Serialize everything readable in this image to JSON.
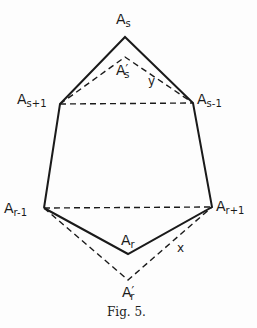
{
  "figure": {
    "caption": "Fig. 5.",
    "vertices": {
      "As": {
        "base": "A",
        "sub": "s",
        "prime": "",
        "x": 125,
        "y": 37
      },
      "Asp": {
        "base": "A",
        "sub": "s",
        "prime": "′",
        "x": 125,
        "y": 57
      },
      "As1p": {
        "base": "A",
        "sub": "s+1",
        "prime": "",
        "x": 60,
        "y": 104
      },
      "As1m": {
        "base": "A",
        "sub": "s-1",
        "prime": "",
        "x": 193,
        "y": 103
      },
      "Ar1m": {
        "base": "A",
        "sub": "r-1",
        "prime": "",
        "x": 44,
        "y": 208
      },
      "Ar1p": {
        "base": "A",
        "sub": "r+1",
        "prime": "",
        "x": 212,
        "y": 207
      },
      "Ar": {
        "base": "A",
        "sub": "r",
        "prime": "",
        "x": 128,
        "y": 254
      },
      "Arp": {
        "base": "A",
        "sub": "r",
        "prime": "′",
        "x": 128,
        "y": 280
      }
    },
    "variables": {
      "y": "y",
      "x": "x"
    },
    "solid_edges": [
      [
        "As",
        "As1p"
      ],
      [
        "As",
        "As1m"
      ],
      [
        "As1p",
        "Ar1m"
      ],
      [
        "As1m",
        "Ar1p"
      ],
      [
        "Ar1m",
        "Ar"
      ],
      [
        "Ar1p",
        "Ar"
      ]
    ],
    "dashed_edges": [
      [
        "As1p",
        "Asp"
      ],
      [
        "As1m",
        "Asp"
      ],
      [
        "As1p",
        "As1m"
      ],
      [
        "Ar1m",
        "Ar1p"
      ],
      [
        "Ar1m",
        "Arp"
      ],
      [
        "Ar1p",
        "Arp"
      ]
    ],
    "stroke_color": "#1a1a1a"
  }
}
